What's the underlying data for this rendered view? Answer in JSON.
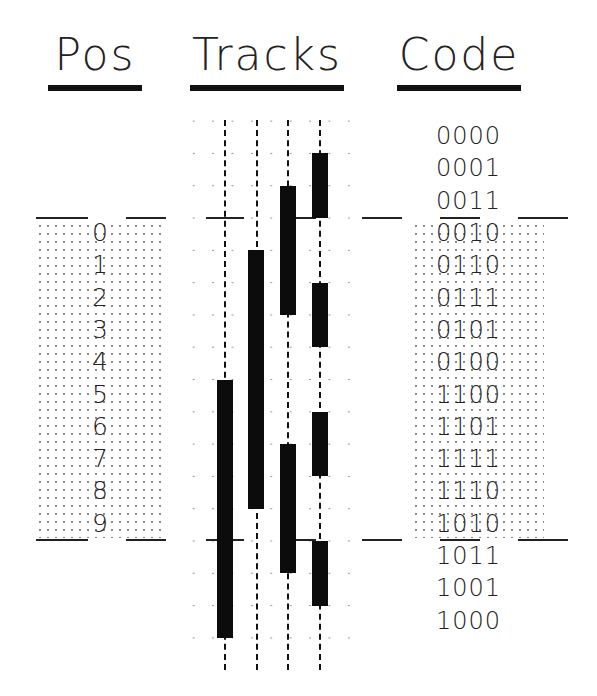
{
  "headers": {
    "pos": "Pos",
    "tracks": "Tracks",
    "code": "Code"
  },
  "positions": [
    "0",
    "1",
    "2",
    "3",
    "4",
    "5",
    "6",
    "7",
    "8",
    "9"
  ],
  "codes": [
    "0000",
    "0001",
    "0011",
    "0010",
    "0110",
    "0111",
    "0101",
    "0100",
    "1100",
    "1101",
    "1111",
    "1110",
    "1010",
    "1011",
    "1001",
    "1000"
  ],
  "window": {
    "first_code_index": 3,
    "last_code_index": 12
  },
  "tracks": [
    {
      "name": "track-1",
      "bit": "MSB",
      "on_ranges": [
        [
          8,
          15
        ]
      ]
    },
    {
      "name": "track-2",
      "bit": "bit-2",
      "on_ranges": [
        [
          4,
          11
        ]
      ]
    },
    {
      "name": "track-3",
      "bit": "bit-3",
      "on_ranges": [
        [
          2,
          5
        ],
        [
          10,
          13
        ]
      ]
    },
    {
      "name": "track-4",
      "bit": "LSB",
      "on_ranges": [
        [
          1,
          2
        ],
        [
          5,
          6
        ],
        [
          9,
          10
        ],
        [
          13,
          14
        ]
      ]
    }
  ],
  "colors": {
    "ink": "#111111",
    "dots": "#8a8a8a",
    "background": "#ffffff"
  }
}
